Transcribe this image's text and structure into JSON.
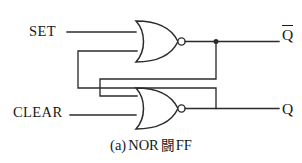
{
  "figure": {
    "caption_prefix": "(a)",
    "caption_gate_type": "NOR",
    "caption_cjk": "闘",
    "caption_suffix": "FF",
    "caption_full": "(a) NOR 闘 FF"
  },
  "inputs": [
    {
      "name": "set",
      "label": "SET"
    },
    {
      "name": "clear",
      "label": "CLEAR"
    }
  ],
  "outputs": [
    {
      "name": "q-bar",
      "label": "Q",
      "overbar": true
    },
    {
      "name": "q",
      "label": "Q",
      "overbar": false
    }
  ],
  "gates": [
    {
      "name": "nor-gate-top",
      "type": "NOR",
      "inputs": [
        "SET",
        "Q"
      ],
      "output": "Q-bar"
    },
    {
      "name": "nor-gate-bottom",
      "type": "NOR",
      "inputs": [
        "Q-bar",
        "CLEAR"
      ],
      "output": "Q"
    }
  ],
  "colors": {
    "wire": "#2b2b2b",
    "text": "#181818",
    "background": "#ffffff"
  }
}
